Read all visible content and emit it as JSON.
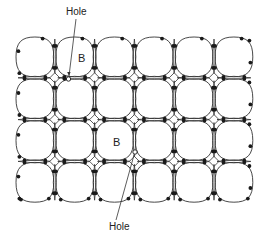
{
  "diagram": {
    "grid": {
      "cols": 6,
      "rows": 4,
      "x0": 15,
      "y0": 36,
      "cell_w": 39.8,
      "cell_h": 41.8
    },
    "colors": {
      "line": "#333333",
      "atom": "#1a1a1a",
      "hole_fill": "#ffffff",
      "background": "#ffffff"
    },
    "dopants": [
      {
        "label": "B",
        "col": 1,
        "row": 0,
        "text_x": 78,
        "text_y": 62
      },
      {
        "label": "B",
        "col": 2,
        "row": 2,
        "text_x": 113,
        "text_y": 146
      }
    ],
    "holes": [
      {
        "x": 68.5,
        "y": 79,
        "label": "Hole",
        "label_x": 66,
        "label_y": 15,
        "line_from": [
          76,
          19
        ],
        "line_to": [
          69,
          76
        ]
      },
      {
        "x": 135,
        "y": 152,
        "label": "Hole",
        "label_x": 109,
        "label_y": 230,
        "line_from": [
          116,
          220
        ],
        "line_to": [
          134,
          155
        ]
      }
    ]
  }
}
